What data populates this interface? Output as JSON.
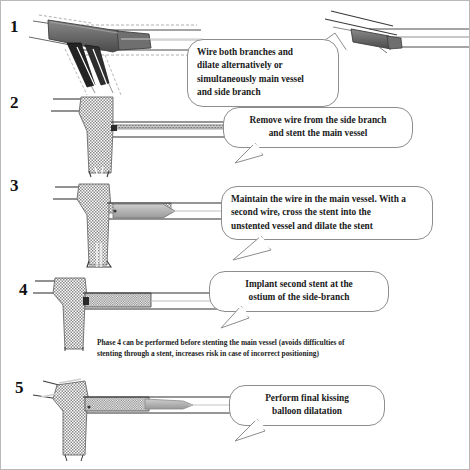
{
  "steps": [
    {
      "number": "1",
      "figure": "bifurcation-two-balloons-kissing"
    },
    {
      "number": "2",
      "figure": "bifurcation-main-vessel-stented"
    },
    {
      "number": "3",
      "figure": "bifurcation-wire-recross-balloon-dilate"
    },
    {
      "number": "4",
      "figure": "bifurcation-second-stent-side-branch-ostium"
    },
    {
      "number": "5",
      "figure": "bifurcation-final-kissing-balloon"
    }
  ],
  "callouts": [
    {
      "id": "callout-1",
      "lines": [
        "Wire both branches and",
        "dilate alternatively or",
        "simultaneously main vessel",
        "and side branch"
      ],
      "align": "left"
    },
    {
      "id": "callout-2",
      "lines": [
        "Remove wire from the side branch",
        "and stent the main vessel"
      ],
      "align": "center"
    },
    {
      "id": "callout-3",
      "lines": [
        "Maintain the wire in the main vessel. With a",
        "second wire, cross the stent into the",
        "unstented vessel and dilate the stent"
      ],
      "align": "left"
    },
    {
      "id": "callout-4",
      "lines": [
        "Implant second stent at the",
        "ostium of the side-branch"
      ],
      "align": "center"
    },
    {
      "id": "callout-5",
      "lines": [
        "Perform final kissing",
        "balloon dilatation"
      ],
      "align": "center"
    }
  ],
  "note": {
    "lines": [
      "Phase 4 can be performed before stenting the main vessel (avoids  difficulties of",
      "stenting through a stent, increases risk in case of  incorrect positioning)"
    ]
  },
  "colors": {
    "balloon_dark": "#6d6d6d",
    "balloon_darkest": "#2b2b2b",
    "balloon_light": "#b3b3b3",
    "stent_mesh": "#8a8a8a",
    "vessel_wall": "#3a3a3a",
    "wire": "#7a7a7a",
    "callout_border": "#8d8d8d",
    "text": "#1a1a1a",
    "frame": "#b9b9b9"
  }
}
